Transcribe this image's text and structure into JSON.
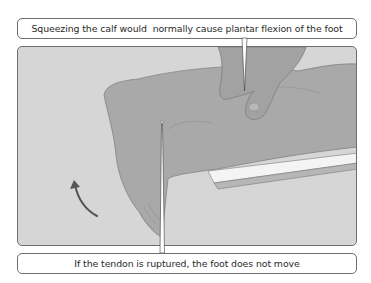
{
  "diagram": {
    "top_caption": "Squeezing the calf would  normally cause plantar flexion of the foot",
    "bottom_caption": "If the tendon is ruptured, the foot does not move",
    "illustration": {
      "subject": "lower leg resting on a bench with a hand squeezing the calf",
      "elements": [
        "leg",
        "foot",
        "hand",
        "bench",
        "curved-arrow"
      ],
      "colors": {
        "background": "#d6d6d6",
        "skin": "#a9a9a9",
        "bench_top": "#f2f2f2",
        "bench_side": "#b8b8b8",
        "arrow": "#555555",
        "border": "#6e6e6e"
      }
    }
  }
}
